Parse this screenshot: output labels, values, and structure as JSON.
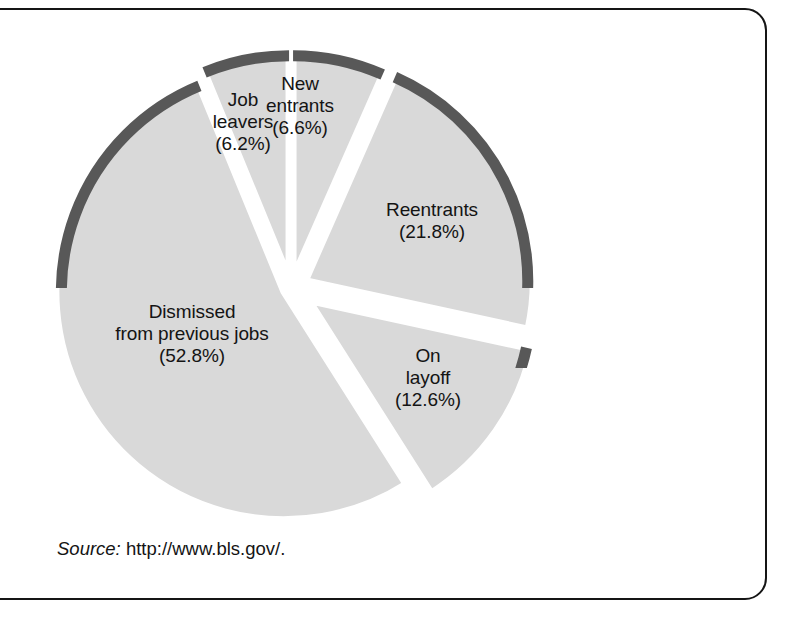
{
  "figure": {
    "frame_color": "#151515",
    "background": "#ffffff"
  },
  "caption": {
    "label": "Source:",
    "url": "http://www.bls.gov/."
  },
  "chart_data": {
    "type": "pie",
    "title": "",
    "subtitle": "",
    "xlabel": "",
    "ylabel": "",
    "legend_position": "none",
    "grid": false,
    "exploded": true,
    "style": "3d-shaded",
    "fill_color": "#d9d9d9",
    "rim_color": "#585858",
    "gap_color": "#ffffff",
    "units": "percent",
    "total": 100.0,
    "categories": [
      "New entrants",
      "Reentrants",
      "On layoff",
      "Dismissed from previous jobs",
      "Job leavers"
    ],
    "values": [
      6.6,
      21.8,
      12.6,
      52.8,
      6.2
    ],
    "slices": [
      {
        "name": "New entrants",
        "label_lines": [
          "New",
          "entrants",
          "(6.6%)"
        ],
        "value": 6.6,
        "value_text": "(6.6%)",
        "start_deg": 0,
        "end_deg": 23.76,
        "explode": 10,
        "label_x": 300,
        "label_y": 73
      },
      {
        "name": "Reentrants",
        "label_lines": [
          "Reentrants",
          "(21.8%)"
        ],
        "value": 21.8,
        "value_text": "(21.8%)",
        "start_deg": 23.76,
        "end_deg": 102.24,
        "explode": 16,
        "label_x": 432,
        "label_y": 199
      },
      {
        "name": "On layoff",
        "label_lines": [
          "On",
          "layoff",
          "(12.6%)"
        ],
        "value": 12.6,
        "value_text": "(12.6%)",
        "start_deg": 102.24,
        "end_deg": 147.6,
        "explode": 22,
        "label_x": 428,
        "label_y": 345
      },
      {
        "name": "Dismissed from previous jobs",
        "label_lines": [
          "Dismissed",
          "from previous jobs",
          "(52.8%)"
        ],
        "value": 52.8,
        "value_text": "(52.8%)",
        "start_deg": 147.6,
        "end_deg": 337.68,
        "explode": 8,
        "label_x": 192,
        "label_y": 301
      },
      {
        "name": "Job leavers",
        "label_lines": [
          "Job",
          "leavers",
          "(6.2%)"
        ],
        "value": 6.2,
        "value_text": "(6.2%)",
        "start_deg": 337.68,
        "end_deg": 360,
        "explode": 10,
        "label_x": 243,
        "label_y": 89
      }
    ],
    "geometry": {
      "center_x": 291,
      "center_y": 288,
      "radius": 228,
      "rim_thickness": 11
    }
  }
}
